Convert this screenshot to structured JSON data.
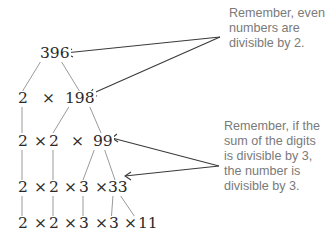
{
  "tree": {
    "rows": [
      {
        "id": "row0",
        "text": "396"
      },
      {
        "id": "row1",
        "text": "2  ×  198"
      },
      {
        "id": "row2",
        "text": "2 × 2   ×   99"
      },
      {
        "id": "row3",
        "text": "2 × 2 × 3 × 33"
      },
      {
        "id": "row4",
        "text": "2 × 2 × 3 × 3 × 11"
      }
    ],
    "tokens": {
      "r0_396": "396",
      "r1_2": "2",
      "r1_x": "×",
      "r1_198": "198",
      "r2_2a": "2",
      "r2_x1": "×",
      "r2_2b": "2",
      "r2_x2": "×",
      "r2_99": "99",
      "r3_2a": "2",
      "r3_x1": "×",
      "r3_2b": "2",
      "r3_x2": "×",
      "r3_3": "3",
      "r3_x3": "×",
      "r3_33": "33",
      "r4_2a": "2",
      "r4_x1": "×",
      "r4_2b": "2",
      "r4_x2": "×",
      "r4_3a": "3",
      "r4_x3": "×",
      "r4_3b": "3",
      "r4_x4": "×",
      "r4_11": "11"
    }
  },
  "notes": {
    "even": "Remember, even\nnumbers are\ndivisible by 2.",
    "digits": "Remember, if the\nsum of the digits\nis divisible by 3,\nthe number is\ndivisible by 3."
  },
  "colors": {
    "line": "#9a9a9a",
    "arrow": "#3a3a3a",
    "number_text": "#2a2a2a",
    "note_text": "#7a7a7a"
  }
}
